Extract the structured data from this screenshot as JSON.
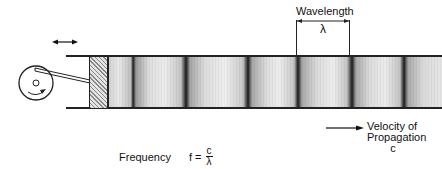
{
  "diagram": {
    "labels": {
      "wavelength": "Wavelength",
      "wavelength_symbol": "λ",
      "frequency_label": "Frequency",
      "frequency_lhs": "f =",
      "frequency_num": "c",
      "frequency_den": "λ",
      "velocity_line1": "Velocity of",
      "velocity_line2": "Propagation",
      "velocity_symbol": "c"
    },
    "components": [
      "crank-wheel",
      "connecting-rod",
      "piston",
      "tube",
      "compression-bands",
      "rarefaction-regions"
    ],
    "colors": {
      "line": "#222222",
      "compression": "#1a1a1a",
      "background": "#ffffff"
    },
    "compression_positions_x": [
      133,
      186,
      248,
      298,
      352,
      404
    ],
    "wavelength_bracket_x": [
      296,
      349
    ]
  }
}
